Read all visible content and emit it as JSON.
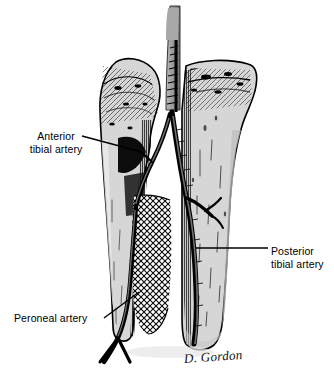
{
  "figure": {
    "style": "black and white pen-and-ink anatomical line drawing",
    "background_color": "#ffffff",
    "ink_color": "#000000",
    "bone_fill_color": "#d9d9d9",
    "shadow_color": "#9a9a9a",
    "signature": "D. Gordon"
  },
  "labels": [
    {
      "id": "anterior-tibial-artery",
      "line1": "Anterior",
      "line2": "tibial artery",
      "align": "center",
      "leader": "diagonal down-right to vessel on fibular neck"
    },
    {
      "id": "posterior-tibial-artery",
      "line1": "Posterior",
      "line2": "tibial artery",
      "align": "left",
      "leader": "horizontal left to vessel on tibial shaft"
    },
    {
      "id": "peroneal-artery",
      "line1": "Peroneal artery",
      "line2": "",
      "align": "left",
      "leader": "diagonal up-right to vessel over interosseous membrane"
    }
  ],
  "structures": [
    {
      "id": "popliteal-artery",
      "name": "popliteal artery",
      "note": "grey vessel descending from top edge"
    },
    {
      "id": "tibia",
      "name": "tibia",
      "note": "large bone on the right with flared condyle at top"
    },
    {
      "id": "fibula",
      "name": "fibula",
      "note": "slender bone on the left with head at top"
    },
    {
      "id": "interosseous-membrane",
      "name": "interosseous membrane",
      "note": "crosshatched area between the two bones"
    }
  ]
}
